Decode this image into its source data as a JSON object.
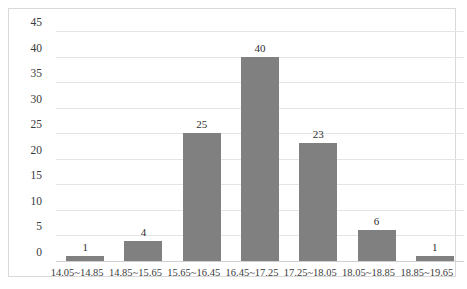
{
  "chart_data": {
    "type": "bar",
    "title": "",
    "subtitle": "",
    "xlabel": "",
    "ylabel": "",
    "categories": [
      "14.05~14.85",
      "14.85~15.65",
      "15.65~16.45",
      "16.45~17.25",
      "17.25~18.05",
      "18.05~18.85",
      "18.85~19.65"
    ],
    "values": [
      1,
      4,
      25,
      40,
      23,
      6,
      1
    ],
    "value_labels": [
      "1",
      "4",
      "25",
      "40",
      "23",
      "6",
      "1"
    ],
    "ylim": [
      0,
      45
    ],
    "ytick_values": [
      0,
      5,
      10,
      15,
      20,
      25,
      30,
      35,
      40,
      45
    ],
    "ytick_labels": [
      "0",
      "5",
      "10",
      "15",
      "20",
      "25",
      "30",
      "35",
      "40",
      "45"
    ],
    "grid": "horizontal",
    "legend": "none",
    "bar_color": "#808080",
    "gridline_color": "#e4e4e4",
    "axis_color": "#cfcfcf",
    "border_color": "#d9d9d9",
    "background_color": "#ffffff",
    "text_color": "#3a3a3a"
  }
}
